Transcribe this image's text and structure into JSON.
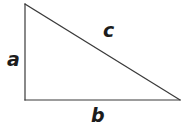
{
  "figure": {
    "name": "right-triangle",
    "background_color": "#ffffff",
    "width": 190,
    "height": 132
  },
  "geometry": {
    "stroke_color": "#3a3a3a",
    "stroke_width": 1.2,
    "fill": "none",
    "vertices": {
      "apex": {
        "x": 25,
        "y": 4
      },
      "right_angle": {
        "x": 25,
        "y": 100
      },
      "base_right": {
        "x": 180,
        "y": 100
      }
    },
    "edges": [
      {
        "name": "leg-a-vertical",
        "from": "apex",
        "to": "right_angle"
      },
      {
        "name": "leg-b-horizontal",
        "from": "right_angle",
        "to": "base_right"
      },
      {
        "name": "hypotenuse-c",
        "from": "apex",
        "to": "base_right"
      }
    ]
  },
  "labels": {
    "leg_vertical": "a",
    "leg_horizontal": "b",
    "hypotenuse": "c",
    "color": "#1c1c1c"
  }
}
